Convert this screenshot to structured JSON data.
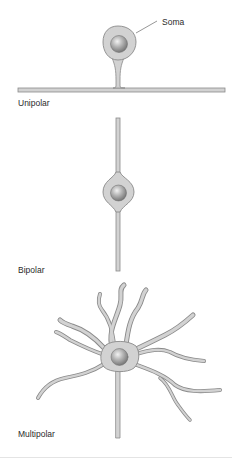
{
  "figure": {
    "panels": [
      {
        "id": "unipolar",
        "label": "Unipolar"
      },
      {
        "id": "bipolar",
        "label": "Bipolar"
      },
      {
        "id": "multipolar",
        "label": "Multipolar"
      }
    ],
    "annotations": [
      {
        "target": "unipolar-soma",
        "text": "Soma"
      }
    ],
    "colors": {
      "cell_fill": "#d2d2d2",
      "cell_outline": "#8a8a8a",
      "nucleus_light": "#e6e6e6",
      "nucleus_dark": "#7a7a7a",
      "text": "#2a2a2a",
      "background": "#ffffff"
    }
  }
}
